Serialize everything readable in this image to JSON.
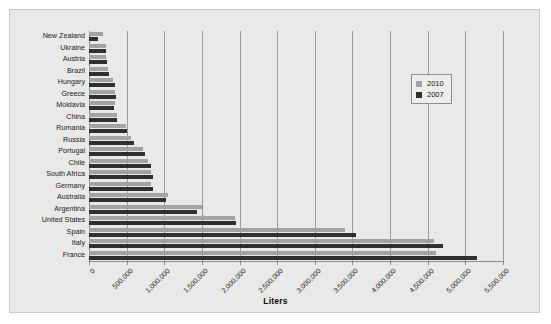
{
  "chart_data": {
    "type": "bar",
    "orientation": "horizontal",
    "title": "",
    "xlabel": "Liters",
    "ylabel": "",
    "xlim": [
      0,
      5500000
    ],
    "grid": true,
    "legend_position": "upper right",
    "xticks": [
      "0",
      "500,000",
      "1,000,000",
      "1,500,000",
      "2,000,000",
      "2,500,000",
      "3,000,000",
      "3,500,000",
      "4,000,000",
      "4,500,000",
      "5,000,000",
      "5,500,000"
    ],
    "categories": [
      "New Zealand",
      "Ukraine",
      "Austria",
      "Brazil",
      "Hungary",
      "Greece",
      "Moldavia",
      "China",
      "Rumania",
      "Russia",
      "Portugal",
      "Chile",
      "South Africa",
      "Germany",
      "Australia",
      "Argentina",
      "United States",
      "Spain",
      "Italy",
      "France"
    ],
    "series": [
      {
        "name": "2010",
        "color": "#a3a3a3",
        "values": [
          190000,
          230000,
          230000,
          250000,
          320000,
          340000,
          340000,
          370000,
          490000,
          560000,
          720000,
          780000,
          820000,
          830000,
          1050000,
          1500000,
          1940000,
          3400000,
          4580000,
          4610000
        ]
      },
      {
        "name": "2007",
        "color": "#2f2f2f",
        "values": [
          120000,
          230000,
          240000,
          270000,
          340000,
          360000,
          330000,
          370000,
          500000,
          600000,
          750000,
          820000,
          850000,
          850000,
          1020000,
          1440000,
          1950000,
          3550000,
          4700000,
          5150000
        ]
      }
    ]
  },
  "legend": {
    "items": [
      {
        "label": "2010",
        "color": "#a3a3a3"
      },
      {
        "label": "2007",
        "color": "#2f2f2f"
      }
    ]
  }
}
